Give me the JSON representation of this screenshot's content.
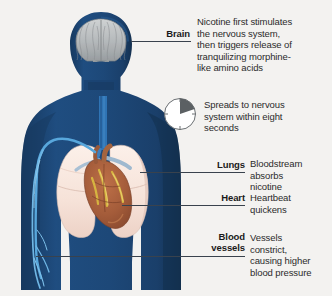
{
  "figure": {
    "name": "human-torso-nicotine-effects",
    "alt": "Front view silhouette of a human head and torso showing brain, lungs, heart and blood vessels",
    "colors": {
      "background": "#f3f2f0",
      "body_silhouette": "#1d4878",
      "body_silhouette_dark": "#173a61",
      "brain": "#b9bcbd",
      "brain_shadow": "#8f9496",
      "lung": "#f7e4dc",
      "lung_shade": "#e8cfc6",
      "heart": "#a8603c",
      "heart_fat": "#d4b33f",
      "vessel": "#4a9fd8",
      "leader_line": "#39424d",
      "text": "#2b2b2b",
      "title_text": "#1a1a1a",
      "clock_wedge": "#555a5d",
      "clock_outline": "#6a6f72"
    }
  },
  "callouts": [
    {
      "id": "brain",
      "title": "Brain",
      "body": "Nicotine first stimulates\nthe nervous system,\nthen triggers release of\ntranquilizing morphine-\nlike amino acids"
    },
    {
      "id": "lungs",
      "title": "Lungs",
      "body": "Bloodstream\nabsorbs\nnicotine"
    },
    {
      "id": "heart",
      "title": "Heart",
      "body": "Heartbeat\nquickens"
    },
    {
      "id": "blood-vessels",
      "title": "Blood\nvessels",
      "body": "Vessels\nconstrict,\ncausing higher\nblood pressure"
    }
  ],
  "clock_note": {
    "icon": "clock-pie-icon",
    "text": "Spreads to nervous\nsystem within eight\nseconds",
    "wedge_label": "eight seconds"
  }
}
